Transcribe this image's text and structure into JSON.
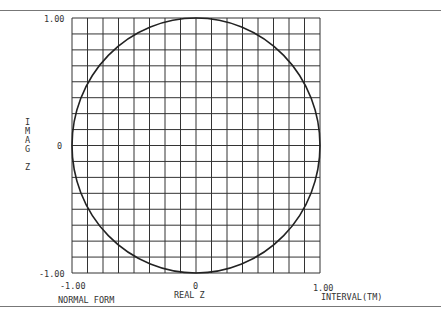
{
  "chart_data": {
    "type": "line",
    "title": "",
    "xlabel": "REAL Z",
    "ylabel": "IMAG Z",
    "xlim": [
      -1.0,
      1.0
    ],
    "ylim": [
      -1.0,
      1.0
    ],
    "grid": true,
    "grid_divisions": 16,
    "x_ticks": [
      "-1.00",
      "0",
      "1.00"
    ],
    "y_ticks": [
      "1.00",
      "0",
      "-1.00"
    ],
    "series": [
      {
        "name": "unit circle |z|=1",
        "shape": "circle",
        "center": [
          0,
          0
        ],
        "radius": 1.0
      }
    ],
    "annotations": [
      "NORMAL FORM",
      "INTERVAL(TM)"
    ]
  },
  "labels": {
    "y_top": "1.00",
    "y_mid": "0",
    "y_bottom": "-1.00",
    "x_left": "-1.00",
    "x_mid": "0",
    "x_right": "1.00",
    "xlabel": "REAL Z",
    "ylabel_chars": [
      "I",
      "M",
      "A",
      "G",
      "",
      "Z"
    ],
    "footer_left": "NORMAL FORM",
    "footer_right": "INTERVAL(TM)"
  }
}
